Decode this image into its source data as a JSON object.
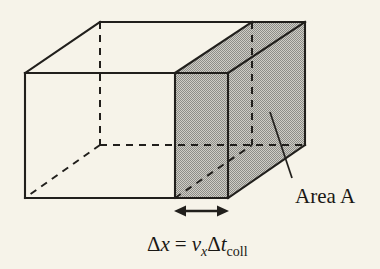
{
  "figure": {
    "type": "physics-diagram",
    "background_color": "#f6f3e9",
    "line_color": "#211f1c",
    "shade_color": "#a8a8a8"
  },
  "labels": {
    "area": {
      "text": "Area A",
      "x": 295,
      "y": 203
    },
    "formula": {
      "full_text": "Δx = v_x Δt_coll",
      "delta_1": "Δ",
      "var_x": "x",
      "equals": "=",
      "var_v": "v",
      "sub_x": "x",
      "delta_2": "Δ",
      "var_t": "t",
      "sub_coll": "coll",
      "x": 147,
      "y": 251
    }
  },
  "geometry": {
    "box": {
      "front_left_x": 25,
      "front_top_y": 73,
      "front_bottom_y": 198,
      "slab_front_x": 175,
      "slab_back_x": 228,
      "right_x": 305,
      "depth_dx": 77,
      "depth_dy": -51,
      "hidden_vertex_x": 100,
      "hidden_vertex_y": 145,
      "top_rear_y": 22
    },
    "dimension_arrow": {
      "x_start": 175,
      "x_end": 228,
      "y": 211
    },
    "leader_line": {
      "x1": 292,
      "y1": 178,
      "x2": 270,
      "y2": 112
    }
  },
  "shaded_faces": [
    "slab-front-face",
    "slab-top-face",
    "box-right-face"
  ]
}
